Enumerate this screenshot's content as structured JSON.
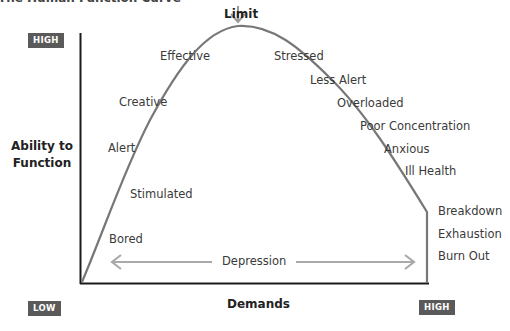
{
  "title": "The Human Function Curve",
  "limit_label": "Limit",
  "y_axis": {
    "label_line1": "Ability to",
    "label_line2": "Function",
    "high_badge": "HIGH",
    "low_badge": "LOW"
  },
  "x_axis": {
    "label": "Demands",
    "high_badge": "HIGH"
  },
  "curve_labels": {
    "bored": "Bored",
    "stimulated": "Stimulated",
    "alert": "Alert",
    "creative": "Creative",
    "effective": "Effective",
    "stressed": "Stressed",
    "less_alert": "Less Alert",
    "overloaded": "Overloaded",
    "poor_concentration": "Poor Concentration",
    "anxious": "Anxious",
    "ill_health": "Ill Health",
    "breakdown": "Breakdown",
    "exhaustion": "Exhaustion",
    "burn_out": "Burn Out"
  },
  "depression_label": "Depression",
  "colors": {
    "curve": "#777777",
    "axis": "#1a1a1a",
    "badge": "#5a5a5a",
    "arrow": "#aaaaaa"
  }
}
